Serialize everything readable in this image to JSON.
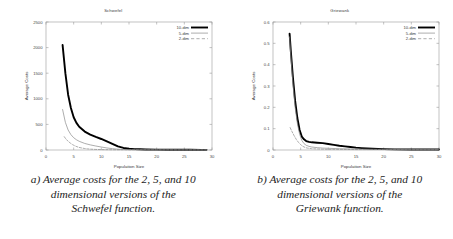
{
  "figure": {
    "panels": [
      {
        "id": "schwefel",
        "caption_lines": [
          "a) Average costs for the 2, 5, and 10",
          "dimensional versions of the",
          "Schwefel function."
        ],
        "chart_data": {
          "type": "line",
          "title": "Schwefel",
          "xlabel": "Population Size",
          "ylabel": "Average Costs",
          "xlim": [
            0,
            30
          ],
          "ylim": [
            0,
            2500
          ],
          "xticks": [
            0,
            5,
            10,
            15,
            20,
            25,
            30
          ],
          "yticks": [
            0,
            500,
            1000,
            1500,
            2000,
            2500
          ],
          "grid": false,
          "legend_position": "top-right",
          "series": [
            {
              "name": "10-dim",
              "style": "thick-solid",
              "color": "#000000",
              "x": [
                3,
                3.5,
                4,
                4.5,
                5,
                5.5,
                6,
                7,
                8,
                9,
                10,
                11,
                12,
                13,
                14,
                15,
                16,
                17,
                18,
                20,
                22,
                24,
                26,
                28,
                29
              ],
              "y": [
                2050,
                1500,
                1080,
                820,
                640,
                530,
                455,
                360,
                300,
                255,
                215,
                170,
                120,
                70,
                40,
                25,
                18,
                14,
                11,
                8,
                6,
                5,
                4,
                3,
                3
              ]
            },
            {
              "name": "5-dim",
              "style": "thin-solid",
              "color": "#8a8a8a",
              "x": [
                3,
                3.5,
                4,
                4.5,
                5,
                5.5,
                6,
                7,
                8,
                9,
                10,
                11,
                12,
                13,
                14,
                15,
                17,
                20,
                24,
                28,
                29
              ],
              "y": [
                790,
                540,
                390,
                300,
                240,
                200,
                170,
                128,
                100,
                78,
                58,
                40,
                26,
                16,
                10,
                7,
                5,
                3,
                2,
                2,
                2
              ]
            },
            {
              "name": "2-dim",
              "style": "dashed",
              "color": "#8a8a8a",
              "x": [
                3.3,
                3.6,
                4,
                4.4,
                4.8,
                5.2,
                5.6,
                6,
                6.5,
                7,
                7.5,
                8,
                9,
                10,
                12,
                15,
                20,
                25,
                29
              ],
              "y": [
                260,
                215,
                170,
                135,
                105,
                82,
                64,
                50,
                38,
                29,
                22,
                17,
                11,
                8,
                5,
                4,
                3,
                2,
                2
              ]
            }
          ]
        }
      },
      {
        "id": "griewank",
        "caption_lines": [
          "b) Average costs for the 2, 5, and 10",
          "dimensional versions of the",
          "Griewank function."
        ],
        "chart_data": {
          "type": "line",
          "title": "Griewank",
          "xlabel": "Population Size",
          "ylabel": "Average Costs",
          "xlim": [
            0,
            30
          ],
          "ylim": [
            0,
            0.6
          ],
          "xticks": [
            0,
            5,
            10,
            15,
            20,
            25,
            30
          ],
          "yticks": [
            0,
            0.1,
            0.2,
            0.3,
            0.4,
            0.5,
            0.6
          ],
          "grid": false,
          "legend_position": "top-right",
          "series": [
            {
              "name": "10-dim",
              "style": "thick-solid",
              "color": "#000000",
              "x": [
                3,
                3.2,
                3.6,
                4,
                4.4,
                4.8,
                5.2,
                5.6,
                6,
                6.5,
                7,
                8,
                9,
                10,
                11,
                12,
                13,
                14,
                15,
                16,
                18,
                20,
                22,
                25,
                28,
                30
              ],
              "y": [
                0.545,
                0.47,
                0.34,
                0.23,
                0.15,
                0.095,
                0.063,
                0.05,
                0.042,
                0.038,
                0.036,
                0.034,
                0.032,
                0.028,
                0.024,
                0.02,
                0.017,
                0.014,
                0.011,
                0.009,
                0.006,
                0.004,
                0.003,
                0.002,
                0.002,
                0.002
              ]
            },
            {
              "name": "5-dim",
              "style": "thin-solid",
              "color": "#8a8a8a",
              "x": [
                3,
                3.2,
                3.6,
                4,
                4.4,
                4.8,
                5.2,
                5.6,
                6,
                6.5,
                7,
                8,
                9,
                10,
                12,
                14,
                16,
                20,
                25,
                30
              ],
              "y": [
                0.53,
                0.45,
                0.31,
                0.2,
                0.125,
                0.075,
                0.045,
                0.03,
                0.022,
                0.017,
                0.014,
                0.011,
                0.009,
                0.008,
                0.006,
                0.005,
                0.004,
                0.003,
                0.002,
                0.002
              ]
            },
            {
              "name": "2-dim",
              "style": "dashed",
              "color": "#8a8a8a",
              "x": [
                3.1,
                3.4,
                3.8,
                4.2,
                4.6,
                5,
                5.4,
                5.8,
                6.2,
                7,
                8,
                9,
                10,
                12,
                15,
                20,
                25,
                30
              ],
              "y": [
                0.105,
                0.088,
                0.068,
                0.05,
                0.036,
                0.025,
                0.017,
                0.012,
                0.009,
                0.006,
                0.005,
                0.004,
                0.003,
                0.003,
                0.002,
                0.002,
                0.001,
                0.001
              ]
            }
          ]
        }
      }
    ]
  }
}
